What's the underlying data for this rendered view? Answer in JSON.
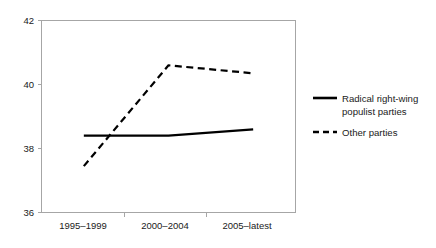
{
  "chart_data": {
    "type": "line",
    "title": "",
    "subtitle": "",
    "xlabel": "",
    "ylabel": "",
    "categories": [
      "1995–1999",
      "2000–2004",
      "2005–latest"
    ],
    "ylim": [
      36,
      42
    ],
    "yticks": [
      36,
      38,
      40,
      42
    ],
    "ytick_labels": [
      "36",
      "38",
      "40",
      "42"
    ],
    "grid": false,
    "legend_position": "right",
    "series": [
      {
        "name": "Radical right-wing populist parties",
        "style": "solid",
        "color": "#000000",
        "values": [
          38.4,
          38.4,
          38.6
        ]
      },
      {
        "name": "Other parties",
        "style": "dashed",
        "color": "#000000",
        "values": [
          37.45,
          40.6,
          40.35
        ]
      }
    ]
  },
  "axis": {
    "ytick_0": "36",
    "ytick_1": "38",
    "ytick_2": "40",
    "ytick_3": "42",
    "xtick_0": "1995–1999",
    "xtick_1": "2000–2004",
    "xtick_2": "2005–latest"
  },
  "legend": {
    "entries": [
      {
        "label_line_1": "Radical right-wing",
        "label_line_2": "populist parties",
        "style": "solid"
      },
      {
        "label_line_1": "Other parties",
        "label_line_2": "",
        "style": "dashed"
      }
    ]
  }
}
